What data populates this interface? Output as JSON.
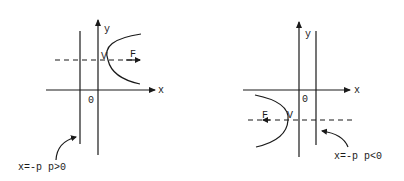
{
  "diagrams": [
    {
      "id": "left",
      "case": "p>0",
      "axis_x_label": "x",
      "axis_y_label": "y",
      "origin_label": "0",
      "vertex_label": "V",
      "focus_label": "F",
      "directrix_label": "x=-p",
      "condition_label": "p>0",
      "opening": "right"
    },
    {
      "id": "right",
      "case": "p<0",
      "axis_x_label": "x",
      "axis_y_label": "y",
      "origin_label": "0",
      "vertex_label": "V",
      "focus_label": "F",
      "directrix_label": "x=-p",
      "condition_label": "p<0",
      "opening": "left"
    }
  ],
  "colors": {
    "ink": "#1a1a1a",
    "background": "#ffffff"
  }
}
